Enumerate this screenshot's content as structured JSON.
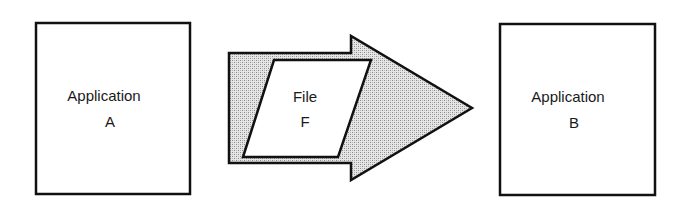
{
  "diagram": {
    "colors": {
      "stroke": "#111111",
      "box_fill": "#ffffff",
      "arrow_fill": "#c8c8c8"
    },
    "source_box": {
      "line1": "Application",
      "line2": "A"
    },
    "transfer": {
      "line1": "File",
      "line2": "F"
    },
    "target_box": {
      "line1": "Application",
      "line2": "B"
    }
  }
}
